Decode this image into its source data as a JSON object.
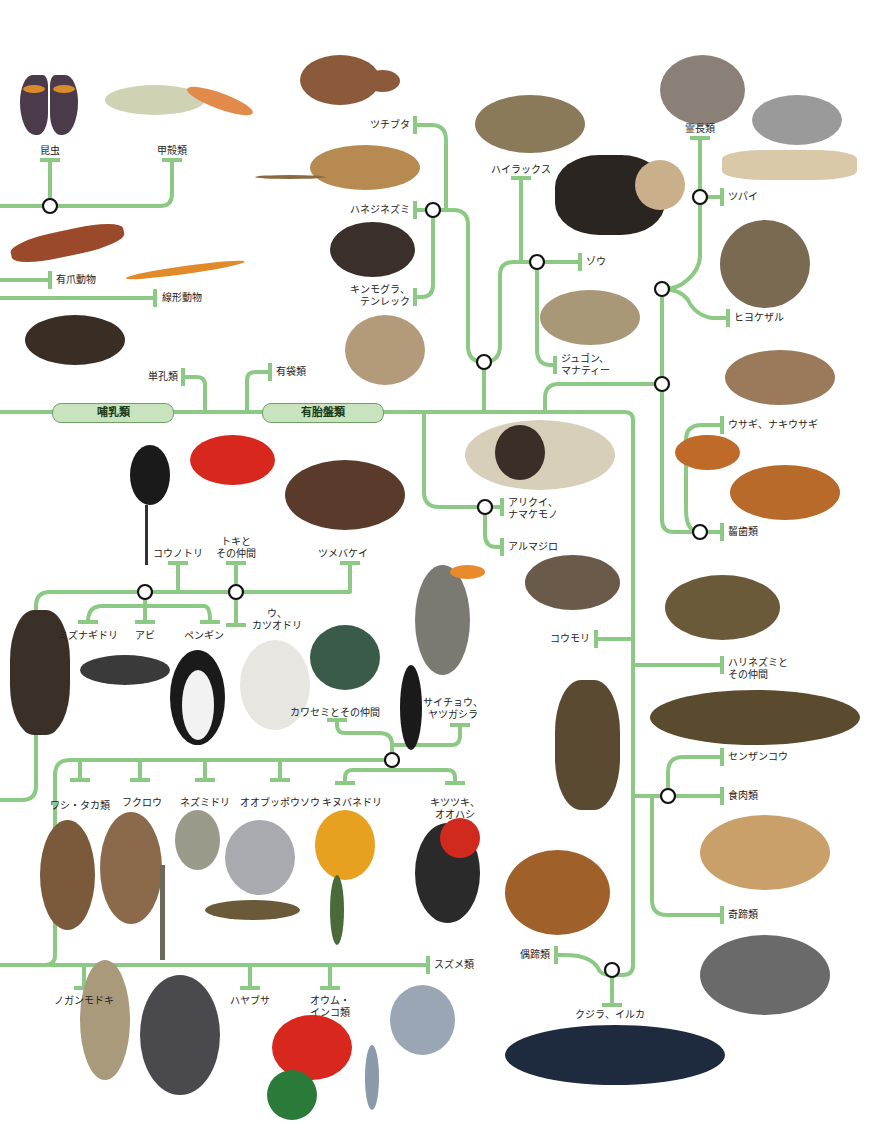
{
  "diagram": {
    "type": "phylogenetic-tree",
    "line_color": "#8cc985",
    "node_stroke": "#111111",
    "clades": {
      "mammals": "哺乳類",
      "placentals": "有胎盤類"
    },
    "labels": {
      "insects": "昆虫",
      "crustaceans": "甲殻類",
      "velvet_worms": "有爪動物",
      "nematodes": "線形動物",
      "monotremes": "単孔類",
      "marsupials": "有袋類",
      "aardvark": "ツチブタ",
      "elephant_shrews": "ハネジネズミ",
      "golden_moles": "キンモグラ、\nテンレック",
      "hyraxes": "ハイラックス",
      "elephants": "ゾウ",
      "dugongs": "ジュゴン、\nマナティー",
      "primates": "霊長類",
      "treeshrews": "ツパイ",
      "colugos": "ヒヨケザル",
      "rabbits": "ウサギ、ナキウサギ",
      "rodents": "齧歯類",
      "anteaters": "アリクイ、\nナマケモノ",
      "armadillos": "アルマジロ",
      "bats": "コウモリ",
      "hedgehogs": "ハリネズミと\nその仲間",
      "pangolins": "センザンコウ",
      "carnivores": "食肉類",
      "perissodactyls": "奇蹄類",
      "artiodactyls": "偶蹄類",
      "whales": "クジラ、イルカ",
      "storks": "コウノトリ",
      "ibises": "トキと\nその仲間",
      "hoatzin": "ツメバケイ",
      "shearwaters": "ミズナギドリ",
      "loons": "アビ",
      "penguins": "ペンギン",
      "cormorants": "ウ、\nカツオドリ",
      "kingfishers": "カワセミとその仲間",
      "hornbills": "サイチョウ、\nヤツガシラ",
      "eagles_hawks": "ワシ・タカ類",
      "owls": "フクロウ",
      "mousebirds": "ネズミドリ",
      "cuckoo_rollers": "オオブッポウソウ",
      "trogons": "キヌバネドリ",
      "woodpeckers": "キツツキ、\nオオハシ",
      "seriemas": "ノガンモドキ",
      "falcons": "ハヤブサ",
      "parrots": "オウム・\nインコ類",
      "passerines": "スズメ類"
    }
  }
}
